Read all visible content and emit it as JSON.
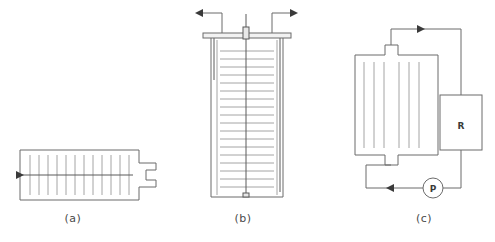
{
  "figure": {
    "background_color": "#ffffff",
    "line_color": "#6b6b6b",
    "internal_line_color": "#9a9a9a",
    "accent_color": "#3a3a3a",
    "width": 495,
    "height": 242
  },
  "panels": [
    {
      "id": "a",
      "caption": "(a)",
      "caption_x": 73,
      "caption_y": 222,
      "orientation": "horizontal",
      "description": "horizontal plate module cross-section with side outlet notch",
      "body": {
        "x": 20,
        "y": 150,
        "width": 119,
        "height": 50
      },
      "internal_line_count": 12,
      "internal_lines_orientation": "vertical",
      "center_axis": true,
      "inlet_arrow": {
        "x": 20,
        "y": 175,
        "direction": "right"
      },
      "outlet_notch": {
        "x": 139,
        "y": 163,
        "width": 17,
        "height": 24
      }
    },
    {
      "id": "b",
      "caption": "(b)",
      "caption_x": 243,
      "caption_y": 222,
      "orientation": "vertical",
      "description": "vertical stacked-plate vessel with lid, center shaft and two top nozzles",
      "body": {
        "x": 211,
        "y": 38,
        "width": 72,
        "height": 159
      },
      "internal_line_count": 18,
      "internal_lines_orientation": "horizontal",
      "lid": {
        "x": 203,
        "y": 33,
        "width": 88,
        "height": 5
      },
      "hub": {
        "x": 243,
        "y": 27,
        "width": 6,
        "height": 12
      },
      "shaft": {
        "x": 246,
        "y": 14,
        "y2": 196
      },
      "left_nozzle": {
        "arrow_x": 197,
        "arrow_y": 13,
        "direction": "left",
        "drop_x": 214,
        "drop_y": 78
      },
      "right_nozzle": {
        "arrow_x": 296,
        "arrow_y": 13,
        "direction": "right",
        "drop_x": 280,
        "drop_y": 192
      }
    },
    {
      "id": "c",
      "caption": "(c)",
      "caption_x": 424,
      "caption_y": 222,
      "orientation": "loop",
      "description": "closed recirculation loop: module with top and bottom necks, reservoir R and pump P",
      "body": {
        "x": 355,
        "y": 55,
        "width": 83,
        "height": 100
      },
      "internal_line_count": 6,
      "internal_lines_orientation": "vertical",
      "top_neck": {
        "x": 385,
        "y": 45,
        "width": 13,
        "height": 10
      },
      "bottom_neck": {
        "x": 385,
        "y": 155,
        "width": 13,
        "height": 10
      },
      "reservoir": {
        "x": 440,
        "y": 95,
        "width": 42,
        "height": 55,
        "label": "R"
      },
      "pump": {
        "cx": 433,
        "cy": 188,
        "r": 10,
        "label": "P"
      },
      "flow_top_arrow": {
        "x": 420,
        "y": 29,
        "direction": "right"
      },
      "flow_bottom_arrow": {
        "x": 390,
        "y": 188,
        "direction": "left"
      }
    }
  ]
}
